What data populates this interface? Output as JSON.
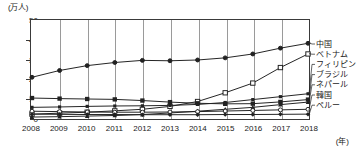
{
  "chart_data": {
    "type": "line",
    "title": "",
    "xlabel": "年",
    "ylabel": "万人",
    "unit_y_label": "(万人)",
    "unit_x_label": "(年)",
    "grid": "vertical",
    "legend_position": "right-inline",
    "xlim": [
      2008,
      2018
    ],
    "ylim": [
      0,
      50
    ],
    "yticks": [
      0,
      10,
      20,
      30,
      40,
      50
    ],
    "categories": [
      2008,
      2009,
      2010,
      2011,
      2012,
      2013,
      2014,
      2015,
      2016,
      2017,
      2018
    ],
    "x": [
      "2008",
      "2009",
      "2010",
      "2011",
      "2012",
      "2013",
      "2014",
      "2015",
      "2016",
      "2017",
      "2018"
    ],
    "series": [
      {
        "name": "中国",
        "marker": "filled-circle",
        "values": [
          21.0,
          24.5,
          27.0,
          28.6,
          29.7,
          29.5,
          29.9,
          31.0,
          33.0,
          36.0,
          38.5
        ]
      },
      {
        "name": "ベトナム",
        "marker": "open-square",
        "values": [
          2.0,
          2.5,
          3.0,
          3.7,
          4.5,
          6.0,
          8.5,
          13.0,
          18.0,
          26.0,
          33.0
        ]
      },
      {
        "name": "フィリピン",
        "marker": "filled-square-small",
        "values": [
          5.5,
          5.7,
          6.0,
          6.2,
          6.3,
          6.5,
          7.0,
          8.0,
          9.5,
          11.0,
          12.5
        ]
      },
      {
        "name": "ブラジル",
        "marker": "filled-square",
        "values": [
          10.3,
          10.0,
          9.8,
          9.6,
          9.0,
          8.2,
          7.6,
          7.3,
          7.4,
          8.3,
          9.5
        ]
      },
      {
        "name": "ネパール",
        "marker": "filled-triangle",
        "values": [
          0.5,
          0.7,
          1.0,
          1.3,
          1.8,
          2.6,
          3.5,
          4.5,
          5.5,
          6.9,
          8.2
        ]
      },
      {
        "name": "韓国",
        "marker": "open-circle",
        "values": [
          3.5,
          3.3,
          3.1,
          3.0,
          3.0,
          3.1,
          3.3,
          3.6,
          3.9,
          4.2,
          4.5
        ]
      },
      {
        "name": "ペルー",
        "marker": "filled-diamond",
        "values": [
          2.0,
          1.9,
          1.8,
          1.8,
          1.7,
          1.7,
          1.7,
          1.8,
          1.8,
          1.9,
          2.0
        ]
      }
    ],
    "legend": [
      "中国",
      "ベトナム",
      "フィリピン",
      "ブラジル",
      "ネパール",
      "韓国",
      "ペルー"
    ],
    "colors": {
      "line": "#222222",
      "grid": "#9a9a9a",
      "frame": "#3a3a3a",
      "text": "#1a1a1a",
      "background": "#ffffff"
    }
  }
}
